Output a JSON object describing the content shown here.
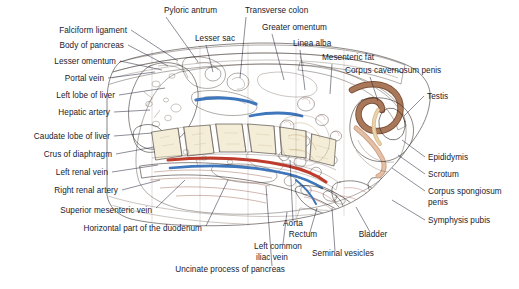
{
  "figure": {
    "background_color": "#ffffff",
    "label_color": "#171a2e",
    "leader_color": "#1a1d33",
    "caption": ""
  },
  "palette": {
    "skin": "#f2cda4",
    "skin_light": "#f7e0c4",
    "subcutaneous_fat": "#f6dfbc",
    "muscle": "#c98d7a",
    "muscle_dark": "#b06a58",
    "liver": "#8d4f42",
    "liver_dark": "#6f3a30",
    "bone_cortex": "#e8ddc0",
    "bone_marrow": "#f3ecd6",
    "vein_blue": "#4a7fc1",
    "artery_red": "#c0392b",
    "bowel_pink": "#dba497",
    "bowel_pink_dark": "#c07f72",
    "mesentery_fat": "#f2d9a4",
    "pancreas": "#d9b87a",
    "outline": "#2a2320",
    "penis_brown": "#9c6a4e",
    "testis_cream": "#f5e3b8",
    "rectum_rose": "#cf8b84",
    "bladder_rose": "#d98f83"
  },
  "labels_left": [
    {
      "id": "falciform-ligament",
      "text": "Falciform ligament",
      "x": 127,
      "y": 33,
      "lx1": 131,
      "ly1": 30,
      "lx2": 178,
      "ly2": 61
    },
    {
      "id": "body-of-pancreas",
      "text": "Body of pancreas",
      "x": 124,
      "y": 48,
      "lx1": 128,
      "ly1": 45,
      "lx2": 168,
      "ly2": 66
    },
    {
      "id": "lesser-omentum",
      "text": "Lesser omentum",
      "x": 116,
      "y": 64,
      "lx1": 120,
      "ly1": 61,
      "lx2": 162,
      "ly2": 70
    },
    {
      "id": "portal-vein",
      "text": "Portal vein",
      "x": 104,
      "y": 81,
      "lx1": 108,
      "ly1": 78,
      "lx2": 155,
      "ly2": 72
    },
    {
      "id": "left-lobe-of-liver",
      "text": "Left lobe of liver",
      "x": 115,
      "y": 98,
      "lx1": 119,
      "ly1": 95,
      "lx2": 165,
      "ly2": 88
    },
    {
      "id": "hepatic-artery",
      "text": "Hepatic artery",
      "x": 110,
      "y": 115,
      "lx1": 114,
      "ly1": 112,
      "lx2": 150,
      "ly2": 110
    },
    {
      "id": "caudate-lobe-of-liver",
      "text": "Caudate lobe of liver",
      "x": 110,
      "y": 139,
      "lx1": 114,
      "ly1": 136,
      "lx2": 152,
      "ly2": 133
    },
    {
      "id": "crus-of-diaphragm",
      "text": "Crus of diaphragm",
      "x": 112,
      "y": 157,
      "lx1": 116,
      "ly1": 154,
      "lx2": 154,
      "ly2": 147
    },
    {
      "id": "left-renal-vein",
      "text": "Left renal vein",
      "x": 108,
      "y": 175,
      "lx1": 112,
      "ly1": 172,
      "lx2": 158,
      "ly2": 165
    },
    {
      "id": "right-renal-artery",
      "text": "Right renal artery",
      "x": 118,
      "y": 193,
      "lx1": 122,
      "ly1": 190,
      "lx2": 160,
      "ly2": 180
    },
    {
      "id": "superior-mesenteric-vein",
      "text": "Superior mesenteric vein",
      "x": 152,
      "y": 213,
      "lx1": 156,
      "ly1": 208,
      "lx2": 185,
      "ly2": 180
    },
    {
      "id": "horizontal-part-of-the-duodenum",
      "text": "Horizontal part of the duodenum",
      "x": 202,
      "y": 231,
      "lx1": 206,
      "ly1": 226,
      "lx2": 228,
      "ly2": 180
    },
    {
      "id": "uncinate-process-of-pancreas",
      "text": "Uncinate process of pancreas",
      "x": 285,
      "y": 272,
      "lx1": 272,
      "ly1": 266,
      "lx2": 266,
      "ly2": 186
    }
  ],
  "labels_top": [
    {
      "id": "pyloric-antrum",
      "text": "Pyloric antrum",
      "x": 164,
      "y": 13,
      "lx1": 166,
      "ly1": 17,
      "lx2": 198,
      "ly2": 62
    },
    {
      "id": "lesser-sac",
      "text": "Lesser sac",
      "x": 195,
      "y": 41,
      "lx1": 206,
      "ly1": 45,
      "lx2": 213,
      "ly2": 72
    },
    {
      "id": "transverse-colon",
      "text": "Transverse colon",
      "x": 245,
      "y": 13,
      "lx1": 246,
      "ly1": 17,
      "lx2": 240,
      "ly2": 78
    },
    {
      "id": "greater-omentum",
      "text": "Greater omentum",
      "x": 262,
      "y": 30,
      "lx1": 272,
      "ly1": 34,
      "lx2": 284,
      "ly2": 80
    },
    {
      "id": "linea-alba",
      "text": "Linea alba",
      "x": 293,
      "y": 46,
      "lx1": 300,
      "ly1": 50,
      "lx2": 305,
      "ly2": 90
    },
    {
      "id": "mesenteric-fat",
      "text": "Mesenteric fat",
      "x": 322,
      "y": 60,
      "lx1": 332,
      "ly1": 64,
      "lx2": 330,
      "ly2": 94
    },
    {
      "id": "corpus-cavernosum-penis",
      "text": "Corpus cavernosum penis",
      "x": 345,
      "y": 73,
      "lx1": 370,
      "ly1": 77,
      "lx2": 378,
      "ly2": 101
    }
  ],
  "labels_right": [
    {
      "id": "testis",
      "text": "Testis",
      "x": 427,
      "y": 99,
      "lx1": 424,
      "ly1": 96,
      "lx2": 404,
      "ly2": 116
    },
    {
      "id": "epididymis",
      "text": "Epididymis",
      "x": 428,
      "y": 160,
      "lx1": 425,
      "ly1": 157,
      "lx2": 402,
      "ly2": 140
    },
    {
      "id": "scrotum",
      "text": "Scrotum",
      "x": 428,
      "y": 177,
      "lx1": 425,
      "ly1": 174,
      "lx2": 398,
      "ly2": 155
    },
    {
      "id": "corpus-spongiosum-penis-1",
      "text": "Corpus spongiosum",
      "x": 428,
      "y": 194,
      "lx1": 425,
      "ly1": 191,
      "lx2": 392,
      "ly2": 168
    },
    {
      "id": "corpus-spongiosum-penis-2",
      "text": "penis",
      "x": 428,
      "y": 205,
      "lx1": null,
      "ly1": null,
      "lx2": null,
      "ly2": null
    },
    {
      "id": "symphysis-pubis",
      "text": "Symphysis pubis",
      "x": 428,
      "y": 223,
      "lx1": 425,
      "ly1": 220,
      "lx2": 392,
      "ly2": 200
    }
  ],
  "labels_bottom": [
    {
      "id": "aorta",
      "text": "Aorta",
      "x": 293,
      "y": 226,
      "lx1": 293,
      "ly1": 221,
      "lx2": 290,
      "ly2": 160
    },
    {
      "id": "rectum",
      "text": "Rectum",
      "x": 303,
      "y": 237,
      "lx1": 310,
      "ly1": 232,
      "lx2": 317,
      "ly2": 208
    },
    {
      "id": "bladder",
      "text": "Bladder",
      "x": 373,
      "y": 237,
      "lx1": 370,
      "ly1": 232,
      "lx2": 356,
      "ly2": 207
    },
    {
      "id": "left-common-iliac-vein-1",
      "text": "Left common",
      "x": 278,
      "y": 249,
      "lx1": null,
      "ly1": null,
      "lx2": null,
      "ly2": null
    },
    {
      "id": "left-common-iliac-vein-2",
      "text": "iliac vein",
      "x": 272,
      "y": 260,
      "lx1": 283,
      "ly1": 244,
      "lx2": 287,
      "ly2": 212
    },
    {
      "id": "seminal-vesicles",
      "text": "Seminal vesicles",
      "x": 343,
      "y": 256,
      "lx1": 335,
      "ly1": 251,
      "lx2": 332,
      "ly2": 208
    }
  ],
  "anatomy_regions": [
    {
      "id": "liver",
      "name": "Left lobe of liver",
      "color": "#8d4f42"
    },
    {
      "id": "caudate-lobe",
      "name": "Caudate lobe of liver",
      "color": "#7d4438"
    },
    {
      "id": "vertebral-bodies",
      "name": "Lumbar vertebral bodies",
      "color": "#f3ecd6"
    },
    {
      "id": "aorta-vessel",
      "name": "Aorta",
      "color": "#c0392b"
    },
    {
      "id": "ivc-vessel",
      "name": "Inferior vena cava",
      "color": "#4a7fc1"
    },
    {
      "id": "bladder-organ",
      "name": "Bladder",
      "color": "#d98f83"
    },
    {
      "id": "rectum-organ",
      "name": "Rectum",
      "color": "#cf8b84"
    },
    {
      "id": "testis-organ",
      "name": "Testis",
      "color": "#f5e3b8"
    },
    {
      "id": "penis-organ",
      "name": "Penis",
      "color": "#9c6a4e"
    },
    {
      "id": "psoas-muscle",
      "name": "Psoas muscle",
      "color": "#b8705c"
    },
    {
      "id": "abdominal-wall",
      "name": "Anterior abdominal wall",
      "color": "#d59a80"
    },
    {
      "id": "mesenteric-fat-region",
      "name": "Mesenteric fat",
      "color": "#f2d9a4"
    },
    {
      "id": "bowel-loops",
      "name": "Small bowel loops",
      "color": "#dba497"
    }
  ]
}
